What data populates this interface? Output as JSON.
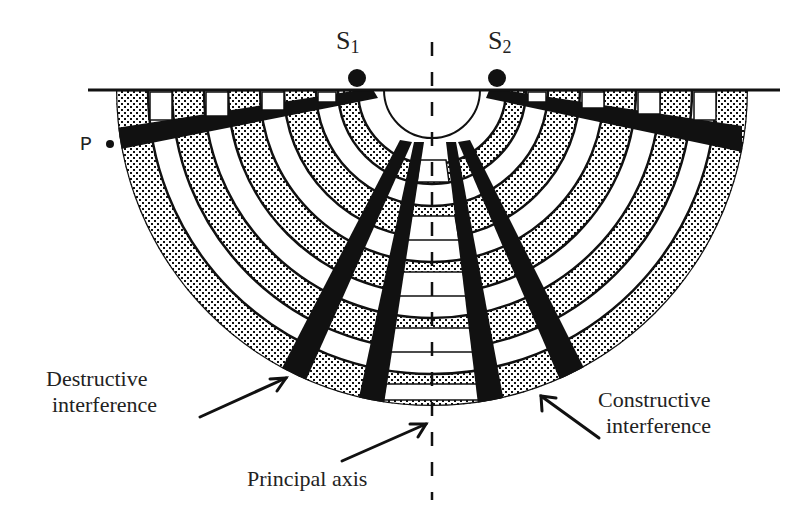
{
  "diagram": {
    "sources": [
      {
        "id": "S1",
        "letter": "S",
        "subscript": "1",
        "x": 357,
        "y": 77
      },
      {
        "id": "S2",
        "letter": "S",
        "subscript": "2",
        "x": 497,
        "y": 77
      }
    ],
    "point_label": "P",
    "labels": {
      "destructive_line1": "Destructive",
      "destructive_line2": "interference",
      "constructive_line1": "Constructive",
      "constructive_line2": "interference",
      "principal_axis": "Principal axis"
    },
    "colors": {
      "ink": "#111111",
      "background": "#ffffff",
      "text": "#222222"
    },
    "geometry": {
      "barrier_y": 90,
      "center_x": 432,
      "outer_radius": 316,
      "inner_radius": 48,
      "ring_count": 11
    }
  }
}
